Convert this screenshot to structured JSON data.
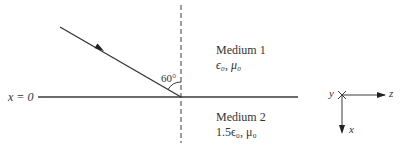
{
  "diagram": {
    "boundary_label": "x = 0",
    "angle_label": "60°",
    "medium1": {
      "name": "Medium 1",
      "params": "ϵ₀, μ₀"
    },
    "medium2": {
      "name": "Medium 2",
      "params": "1.5ϵ₀, μ₀"
    },
    "axes": {
      "y_label": "y",
      "z_label": "z",
      "x_label": "x"
    },
    "colors": {
      "line": "#3a3a3a",
      "background": "#ffffff"
    }
  }
}
